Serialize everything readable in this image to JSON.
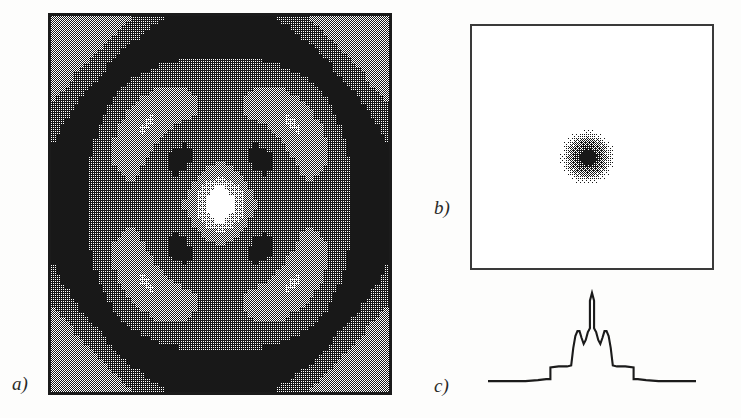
{
  "figure": {
    "kind": "scientific-figure",
    "panel_count": 3,
    "background_color": "#fdfdfc",
    "ink_color": "#1b1b1b"
  },
  "labels": {
    "a": "a)",
    "b": "b)",
    "c": "c)"
  },
  "panel_a": {
    "name": "density-contour-map",
    "description": "Square halftone density map with four-fold symmetric concentric ring structure",
    "frame": {
      "x": 48,
      "y": 13,
      "width": 344,
      "height": 382,
      "border_px": 3,
      "border_color": "#1b1b1b"
    },
    "grid": {
      "nx": 72,
      "ny": 80
    },
    "gray_levels": [
      "#ffffff",
      "#c9c9c9",
      "#8f8f8f",
      "#5a5a5a",
      "#1b1b1b"
    ],
    "level_thresholds": [
      0.16,
      0.34,
      0.55,
      0.78
    ],
    "field": {
      "type": "radial-cosine-lattice",
      "center": [
        0.5,
        0.5
      ],
      "rings": [
        {
          "radius": 0.0,
          "level": "light-core"
        },
        {
          "radius": 0.11,
          "level": "mid-gray-ring"
        },
        {
          "radius": 0.17,
          "level": "dark-diamond-ring"
        },
        {
          "radius": 0.24,
          "level": "white-ring"
        },
        {
          "radius": 0.36,
          "level": "mid-gray-broad-annulus"
        },
        {
          "radius": 0.47,
          "level": "dark-outer-ring"
        },
        {
          "radius": 0.56,
          "level": "white-corner-gap"
        }
      ],
      "lobes": {
        "count": 4,
        "orientation_deg": [
          0,
          90,
          180,
          270
        ],
        "inner_bar_radius": 0.3,
        "outer_bar_radius": 0.0
      },
      "corner_blobs": {
        "count": 4,
        "level": "mid-gray",
        "radius_fraction": 0.18
      }
    }
  },
  "panel_b": {
    "name": "fourier-transform-square",
    "description": "Empty white square frame containing a single small dithered dark blob near the centre",
    "frame": {
      "x": 470,
      "y": 24,
      "width": 244,
      "height": 246,
      "border_px": 2,
      "border_color": "#3a3a3a"
    },
    "blob": {
      "center_fraction": [
        0.48,
        0.54
      ],
      "radius_px": 30,
      "core_pattern": "four-fold-cross",
      "dither": "halftone-checker",
      "peak_gray": "#1b1b1b",
      "halo_gray": "#9a9a9a"
    }
  },
  "panel_c": {
    "name": "line-profile-plot",
    "description": "One-dimensional intensity profile: flat baseline, stepped shoulders, twin side peaks and a tall narrow central spike",
    "frame": {
      "x": 470,
      "y": 283,
      "width": 244,
      "height": 118
    },
    "stroke_color": "#1b1b1b",
    "stroke_width": 2.1
  },
  "chart_data": {
    "type": "line",
    "title": "",
    "xlabel": "",
    "ylabel": "",
    "xlim": [
      0,
      100
    ],
    "ylim": [
      0,
      100
    ],
    "grid": false,
    "legend": null,
    "series": [
      {
        "name": "intensity-profile",
        "x": [
          0,
          6,
          12,
          18,
          24,
          28,
          30,
          30,
          34,
          38,
          40,
          41,
          42,
          43,
          44,
          45,
          46,
          47,
          48,
          48.5,
          49,
          49,
          50,
          51,
          51,
          51.5,
          52,
          53,
          54,
          55,
          56,
          57,
          58,
          59,
          60,
          62,
          66,
          70,
          70,
          72,
          76,
          82,
          88,
          94,
          100
        ],
        "y": [
          6,
          6,
          6,
          6,
          7,
          8,
          8,
          20,
          21,
          21,
          22,
          40,
          52,
          57,
          57,
          50,
          44,
          48,
          56,
          58,
          60,
          88,
          96,
          88,
          60,
          58,
          56,
          48,
          44,
          50,
          57,
          57,
          52,
          40,
          22,
          21,
          21,
          20,
          8,
          8,
          7,
          6,
          6,
          6,
          6
        ]
      }
    ],
    "annotations": [
      {
        "text": "central spike",
        "x": 50,
        "y": 96
      },
      {
        "text": "left shoulder peak",
        "x": 43.5,
        "y": 57
      },
      {
        "text": "right shoulder peak",
        "x": 56.5,
        "y": 57
      },
      {
        "text": "baseline",
        "x": 15,
        "y": 6
      }
    ]
  }
}
